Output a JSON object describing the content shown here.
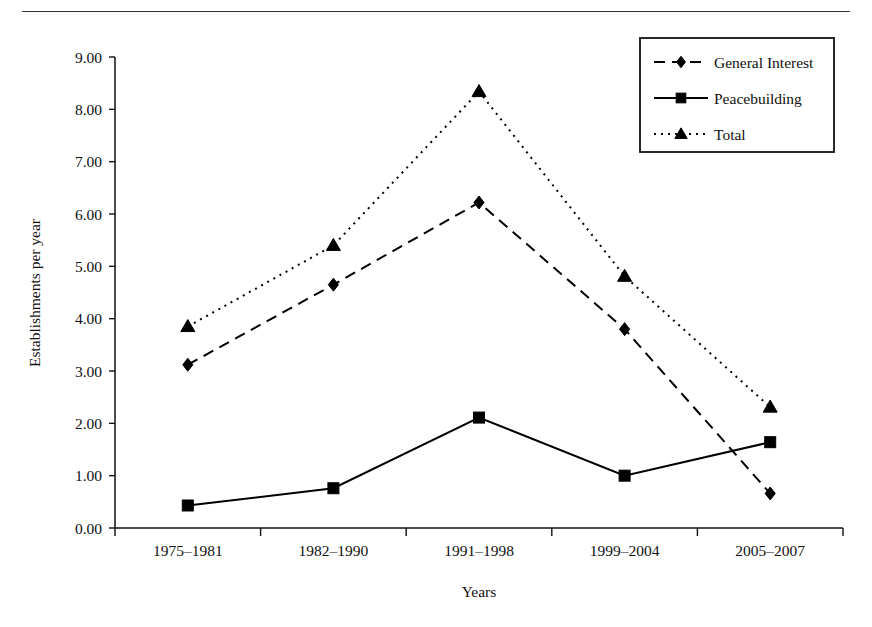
{
  "chart_data": {
    "type": "line",
    "title": "",
    "xlabel": "Years",
    "ylabel": "Establishments per year",
    "categories": [
      "1975–1981",
      "1982–1990",
      "1991–1998",
      "1999–2004",
      "2005–2007"
    ],
    "ylim": [
      0,
      9
    ],
    "ytick_labels": [
      "0.00",
      "1.00",
      "2.00",
      "3.00",
      "4.00",
      "5.00",
      "6.00",
      "7.00",
      "8.00",
      "9.00"
    ],
    "ytick_values": [
      0,
      1,
      2,
      3,
      4,
      5,
      6,
      7,
      8,
      9
    ],
    "grid": false,
    "legend_position": "top-right",
    "series": [
      {
        "name": "General Interest",
        "values": [
          3.12,
          4.65,
          6.22,
          3.8,
          0.66
        ],
        "line_style": "dashed",
        "marker": "diamond",
        "color": "#000000"
      },
      {
        "name": "Peacebuilding",
        "values": [
          0.43,
          0.76,
          2.11,
          1.0,
          1.64
        ],
        "line_style": "solid",
        "marker": "square",
        "color": "#000000"
      },
      {
        "name": "Total",
        "values": [
          3.85,
          5.4,
          8.34,
          4.81,
          2.31
        ],
        "line_style": "dotted",
        "marker": "triangle",
        "color": "#000000"
      }
    ]
  }
}
